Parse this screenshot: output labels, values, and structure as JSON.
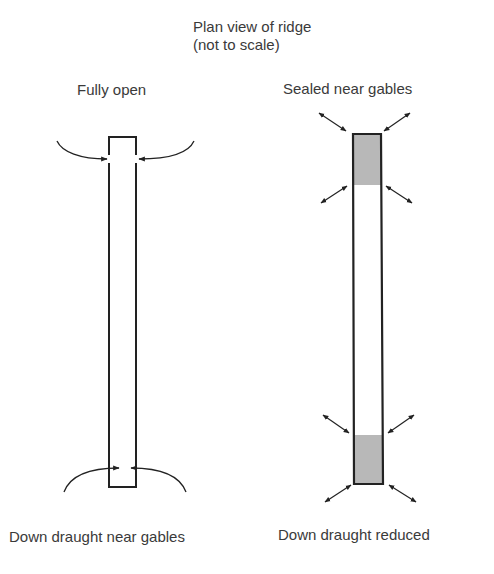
{
  "title": "Plan view of ridge",
  "subtitle": "(not to scale)",
  "panels": [
    {
      "id": "fully-open",
      "top_label": "Fully open",
      "bottom_label": "Down draught near gables"
    },
    {
      "id": "sealed-near-gables",
      "top_label": "Sealed  near gables",
      "bottom_label": "Down draught reduced"
    }
  ],
  "colors": {
    "line": "#222222",
    "seal_fill": "#b8b8b8",
    "text": "#3a3a3a"
  }
}
